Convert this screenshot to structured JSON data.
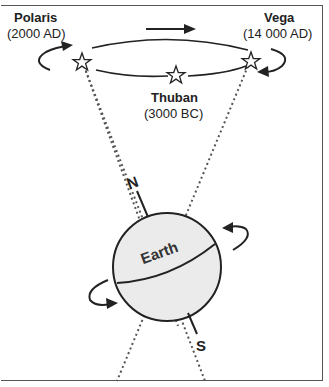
{
  "diagram": {
    "stars": [
      {
        "name": "Polaris",
        "date": "(2000 AD)"
      },
      {
        "name": "Vega",
        "date": "(14 000 AD)"
      },
      {
        "name": "Thuban",
        "date": "(3000 BC)"
      }
    ],
    "earth_label": "Earth",
    "north_label": "N",
    "south_label": "S",
    "colors": {
      "earth_fill": "#ebebeb",
      "line": "#222222",
      "dotted": "#555555"
    }
  }
}
